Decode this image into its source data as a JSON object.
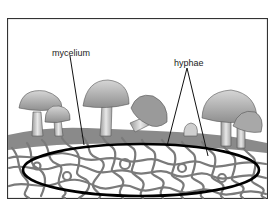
{
  "diagram": {
    "labels": {
      "mycelium": "mycelium",
      "hyphae": "hyphae"
    },
    "colors": {
      "border": "#333333",
      "outline_ellipse": "#000000",
      "hyphae_stroke": "#777777",
      "mushroom_cap": "#bdbdbd",
      "mushroom_stem": "#d9d9d9",
      "ground": "#8a8a8a",
      "background": "#ffffff"
    }
  }
}
